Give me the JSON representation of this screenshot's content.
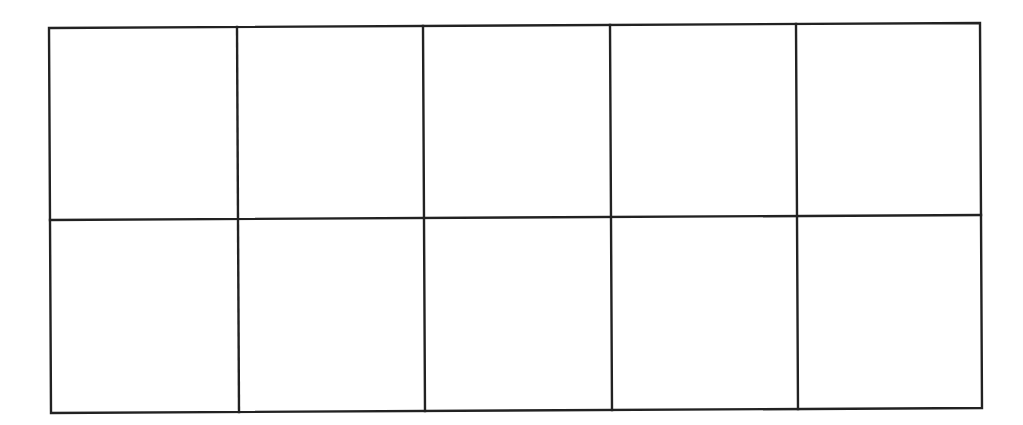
{
  "diagram": {
    "type": "empty-grid",
    "rows": 2,
    "columns": 5,
    "line_color": "#222222",
    "background_color": "#ffffff",
    "outer_corners": {
      "top_left": [
        49,
        28
      ],
      "top_right": [
        980,
        23
      ],
      "bottom_right": [
        982,
        408
      ],
      "bottom_left": [
        51,
        413
      ]
    },
    "middle_row_line": {
      "left": [
        50,
        220
      ],
      "right": [
        981,
        215
      ]
    },
    "column_lines": [
      {
        "top": [
          237,
          27
        ],
        "bottom": [
          239,
          412
        ]
      },
      {
        "top": [
          423,
          26
        ],
        "bottom": [
          425,
          411
        ]
      },
      {
        "top": [
          610,
          25
        ],
        "bottom": [
          612,
          410
        ]
      },
      {
        "top": [
          796,
          24
        ],
        "bottom": [
          798,
          409
        ]
      }
    ],
    "cells": [
      {
        "row": 1,
        "col": 1,
        "label": ""
      },
      {
        "row": 1,
        "col": 2,
        "label": ""
      },
      {
        "row": 1,
        "col": 3,
        "label": ""
      },
      {
        "row": 1,
        "col": 4,
        "label": ""
      },
      {
        "row": 1,
        "col": 5,
        "label": ""
      },
      {
        "row": 2,
        "col": 1,
        "label": ""
      },
      {
        "row": 2,
        "col": 2,
        "label": ""
      },
      {
        "row": 2,
        "col": 3,
        "label": ""
      },
      {
        "row": 2,
        "col": 4,
        "label": ""
      },
      {
        "row": 2,
        "col": 5,
        "label": ""
      }
    ]
  }
}
